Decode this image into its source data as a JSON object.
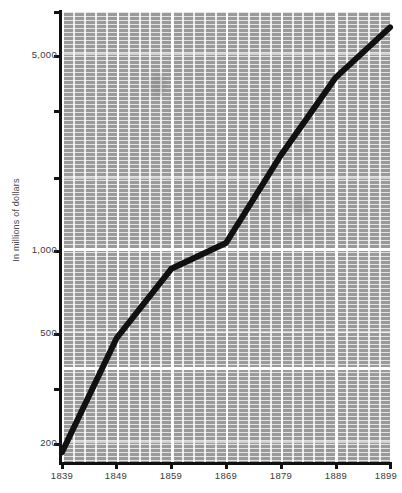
{
  "chart_data": {
    "type": "line",
    "title": "",
    "subtitle": "",
    "xlabel": "",
    "ylabel": "In millions of dollars",
    "yscale": "log",
    "grid": true,
    "legend": "none",
    "xlim": [
      1839,
      1899
    ],
    "ylim": [
      170,
      7000
    ],
    "x": [
      1839,
      1849,
      1859,
      1869,
      1879,
      1889,
      1899
    ],
    "xtick_labels": [
      "1839",
      "1849",
      "1859",
      "1869",
      "1879",
      "1889",
      "1899"
    ],
    "ytick_labels": [
      "5,000",
      "1,000",
      "500",
      "200"
    ],
    "ytick_values": [
      5000,
      1000,
      500,
      200
    ],
    "series": [
      {
        "name": "Value",
        "values": [
          185,
          480,
          855,
          1060,
          2200,
          4200,
          6400
        ]
      }
    ],
    "line_color": "#111111",
    "line_width": 6,
    "plot_background": "#9a9a9a",
    "grid_color": "#ffffff",
    "page_background": "#ffffff",
    "text_color": "#3c3c3c"
  }
}
